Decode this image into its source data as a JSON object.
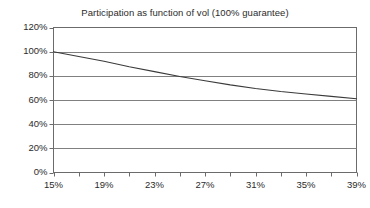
{
  "chart_data": {
    "type": "line",
    "title": "Participation as function of vol (100% guarantee)",
    "xlabel": "",
    "ylabel": "",
    "x": [
      15,
      17,
      19,
      21,
      23,
      25,
      27,
      29,
      31,
      33,
      35,
      37,
      39
    ],
    "x_unit": "%",
    "values": [
      100,
      96,
      92,
      87.5,
      83.5,
      79.5,
      76,
      72.5,
      69.5,
      67,
      65,
      63,
      61
    ],
    "y_unit": "%",
    "xlim": [
      15,
      39
    ],
    "ylim": [
      0,
      120
    ],
    "y_ticks": [
      0,
      20,
      40,
      60,
      80,
      100,
      120
    ],
    "y_tick_labels": [
      "0%",
      "20%",
      "40%",
      "60%",
      "80%",
      "100%",
      "120%"
    ],
    "x_ticks": [
      15,
      17,
      19,
      21,
      23,
      25,
      27,
      29,
      31,
      33,
      35,
      37,
      39
    ],
    "x_tick_labels": [
      "15%",
      "",
      "19%",
      "",
      "23%",
      "",
      "27%",
      "",
      "31%",
      "",
      "35%",
      "",
      "39%"
    ],
    "x_major_tick_labels": [
      "15%",
      "19%",
      "23%",
      "27%",
      "31%",
      "35%",
      "39%"
    ],
    "grid": "horizontal",
    "legend": null,
    "series_name": "Participation",
    "line_color": "#3a3a3a",
    "grid_color": "#808080",
    "axis_color": "#6b6b6b",
    "background": "#ffffff",
    "text_color": "#2b2b2b"
  }
}
